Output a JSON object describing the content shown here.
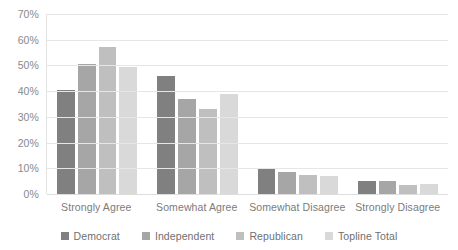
{
  "chart_data": {
    "type": "bar",
    "title": "",
    "subtitle": "",
    "xlabel": "",
    "ylabel": "",
    "ylim": [
      0,
      70
    ],
    "ytick_step": 10,
    "ytick_labels": [
      "0%",
      "10%",
      "20%",
      "30%",
      "40%",
      "50%",
      "60%",
      "70%"
    ],
    "ytick_values": [
      0,
      10,
      20,
      30,
      40,
      50,
      60,
      70
    ],
    "grid": true,
    "legend_position": "bottom",
    "value_format": "percent",
    "categories": [
      "Strongly Agree",
      "Somewhat Agree",
      "Somewhat Disagree",
      "Strongly Disagree"
    ],
    "series": [
      {
        "name": "Democrat",
        "color": "#808080",
        "values": [
          40.5,
          46,
          10,
          5
        ]
      },
      {
        "name": "Independent",
        "color": "#a6a6a6",
        "values": [
          50.5,
          37,
          8.5,
          5
        ]
      },
      {
        "name": "Republican",
        "color": "#bfbfbf",
        "values": [
          57,
          33,
          7.5,
          3.5
        ]
      },
      {
        "name": "Topline Total",
        "color": "#d9d9d9",
        "values": [
          49.5,
          39,
          7,
          4
        ]
      }
    ]
  },
  "colors": {
    "background": "#ffffff",
    "gridline": "#e6e6e6",
    "axis_text": "#898989",
    "label_text": "#7b7b7b",
    "legend_text": "#6f6f6f"
  }
}
